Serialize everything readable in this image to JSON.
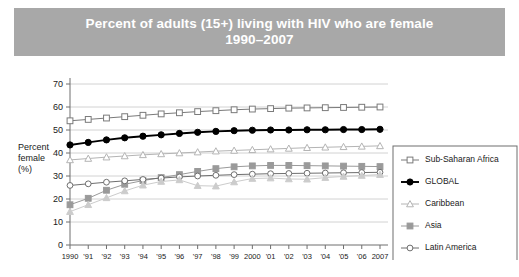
{
  "title": {
    "line1": "Percent of adults (15+) living with HIV who are female",
    "line2": "1990–2007",
    "banner_color": "#a8a8a8",
    "text_color": "#ffffff"
  },
  "chart_data": {
    "type": "line",
    "title": "Percent of adults (15+) living with HIV who are female 1990–2007",
    "xlabel": "",
    "ylabel": "Percent female (%)",
    "ylabel_lines": [
      "Percent",
      "female",
      "(%)"
    ],
    "ylim": [
      0,
      70
    ],
    "ytick_step": 10,
    "yticks": [
      0,
      10,
      20,
      30,
      40,
      50,
      60,
      70
    ],
    "grid": "horizontal",
    "legend_position": "right",
    "x": [
      1990,
      1991,
      1992,
      1993,
      1994,
      1995,
      1996,
      1997,
      1998,
      1999,
      2000,
      2001,
      2002,
      2003,
      2004,
      2005,
      2006,
      2007
    ],
    "categories": [
      "1990",
      "'91",
      "'92",
      "'93",
      "'94",
      "'95",
      "'96",
      "'97",
      "'98",
      "'99",
      "2000",
      "'01",
      "'02",
      "'03",
      "'04",
      "'05",
      "'06",
      "2007"
    ],
    "series": [
      {
        "name": "Sub-Saharan Africa",
        "marker": "open-square",
        "color": "#7a7a7a",
        "marker_fill": "#ffffff",
        "values": [
          54.0,
          54.6,
          55.2,
          55.8,
          56.4,
          57.0,
          57.5,
          58.0,
          58.4,
          58.8,
          59.1,
          59.3,
          59.5,
          59.6,
          59.7,
          59.8,
          59.9,
          60.0
        ]
      },
      {
        "name": "GLOBAL",
        "marker": "filled-circle",
        "color": "#000000",
        "marker_fill": "#000000",
        "values": [
          43.5,
          44.6,
          45.7,
          46.6,
          47.3,
          47.9,
          48.5,
          49.0,
          49.4,
          49.7,
          49.9,
          50.0,
          50.0,
          50.1,
          50.1,
          50.2,
          50.2,
          50.3
        ]
      },
      {
        "name": "Caribbean",
        "marker": "open-triangle",
        "color": "#b4b4b4",
        "marker_fill": "#ffffff",
        "values": [
          37.0,
          37.6,
          38.2,
          38.7,
          39.2,
          39.6,
          40.0,
          40.4,
          40.8,
          41.1,
          41.4,
          41.7,
          42.0,
          42.3,
          42.5,
          42.7,
          42.9,
          43.1
        ]
      },
      {
        "name": "Asia",
        "marker": "filled-square",
        "color": "#9a9a9a",
        "marker_fill": "#9a9a9a",
        "values": [
          17.5,
          20.3,
          23.8,
          26.4,
          28.0,
          29.3,
          30.6,
          32.0,
          33.2,
          34.0,
          34.4,
          34.6,
          34.6,
          34.5,
          34.4,
          34.3,
          34.2,
          34.1
        ]
      },
      {
        "name": "Latin America",
        "marker": "open-circle",
        "color": "#6e6e6e",
        "marker_fill": "#ffffff",
        "values": [
          25.9,
          26.6,
          27.3,
          27.9,
          28.5,
          29.1,
          29.6,
          30.0,
          30.3,
          30.6,
          30.8,
          31.0,
          31.1,
          31.2,
          31.3,
          31.4,
          31.5,
          31.6
        ]
      },
      {
        "name": "Eastern Europe & Central Asia",
        "marker": "light-triangle",
        "color": "#cccccc",
        "marker_fill": "#cccccc",
        "values": [
          14.5,
          17.5,
          20.5,
          23.5,
          26.0,
          27.6,
          28.3,
          25.8,
          25.6,
          27.4,
          28.9,
          29.1,
          28.7,
          28.6,
          29.3,
          29.8,
          30.2,
          30.6
        ]
      }
    ]
  },
  "legend": {
    "entries": [
      {
        "label": "Sub-Saharan Africa"
      },
      {
        "label": "GLOBAL"
      },
      {
        "label": "Caribbean"
      },
      {
        "label": "Asia"
      },
      {
        "label": "Latin America"
      },
      {
        "label_line1": "Eastern Europe",
        "label_line2": "& Central Asia"
      }
    ]
  }
}
